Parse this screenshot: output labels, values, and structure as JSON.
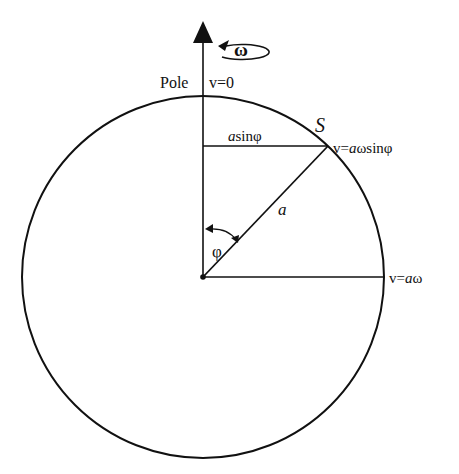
{
  "diagram": {
    "labels": {
      "omega": "ω",
      "pole": "Pole",
      "v_pole": "v=0",
      "point_s": "S",
      "a_sin_phi_italic": "a",
      "a_sin_phi_rest": "sinφ",
      "v_s_prefix": "v=",
      "v_s_italic": "a",
      "v_s_rest": "ωsinφ",
      "radius": "a",
      "angle": "φ",
      "v_eq_prefix": "v=",
      "v_eq_italic": "a",
      "v_eq_rest": "ω"
    },
    "geometry": {
      "center": [
        203,
        276
      ],
      "radius": 181,
      "point_s": [
        328,
        146
      ]
    },
    "colors": {
      "line": "#111111",
      "background": "#ffffff"
    }
  }
}
